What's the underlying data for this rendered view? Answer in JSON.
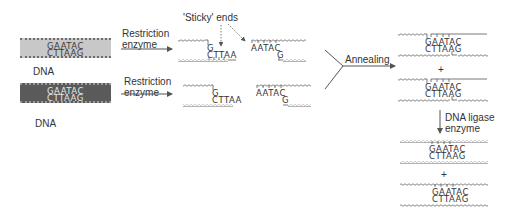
{
  "diagram": {
    "left": {
      "dna1": {
        "top_seq": "GAATAC",
        "bottom_seq": "CTTAAG",
        "label": "DNA",
        "fill": "#c8c8c8"
      },
      "dna2": {
        "top_seq": "GAATAC",
        "bottom_seq": "CTTAAG",
        "label": "DNA",
        "fill": "#5a5a5a"
      }
    },
    "arrows": {
      "restriction1": "Restriction\nenzyme",
      "restriction1_line1": "Restriction",
      "restriction1_line2": "enzyme",
      "restriction2_line1": "Restriction",
      "restriction2_line2": "enzyme",
      "annealing": "Annealing",
      "ligase_line1": "DNA ligase",
      "ligase_line2": "enzyme"
    },
    "callout": {
      "sticky_ends": "'Sticky' ends"
    },
    "cut_fragments": {
      "row1": {
        "left_top": "G",
        "left_bottom": "CTTAA",
        "right_top": "AATAC",
        "right_bottom": "G"
      },
      "row2": {
        "left_top": "G",
        "left_bottom": "CTTAA",
        "right_top": "AATAC",
        "right_bottom": "G"
      }
    },
    "annealed": [
      {
        "top_seq": "GAATAC",
        "bottom_seq": "CTTAAG"
      },
      {
        "top_seq": "GAATAC",
        "bottom_seq": "CTTAAG"
      }
    ],
    "ligated": [
      {
        "top_seq": "GAATAC",
        "bottom_seq": "CTTAAG"
      },
      {
        "top_seq": "GAATAC",
        "bottom_seq": "CTTAAG"
      }
    ],
    "plus": "+",
    "colors": {
      "line": "#555555",
      "light_dna": "#c8c8c8",
      "dark_dna": "#5a5a5a"
    }
  }
}
